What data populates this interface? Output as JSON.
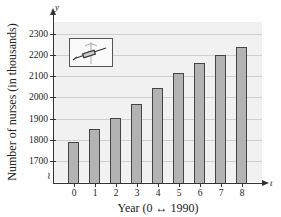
{
  "chart_data": {
    "type": "bar",
    "title": "",
    "xlabel": "Year (0 ↔ 1990)",
    "ylabel": "Number of nurses (in thousands)",
    "x_axis_variable": "t",
    "y_axis_variable": "y",
    "categories": [
      "0",
      "1",
      "2",
      "3",
      "4",
      "5",
      "6",
      "7",
      "8"
    ],
    "values": [
      1790,
      1853,
      1905,
      1968,
      2043,
      2116,
      2162,
      2202,
      2239
    ],
    "yticks": [
      "1700",
      "1800",
      "1900",
      "2000",
      "2100",
      "2200",
      "2300"
    ],
    "ylim": [
      1600,
      2350
    ],
    "y_axis_break": true,
    "grid": true,
    "legend": null,
    "annotations": [
      "syringe and caduceus illustration in upper-left"
    ]
  }
}
